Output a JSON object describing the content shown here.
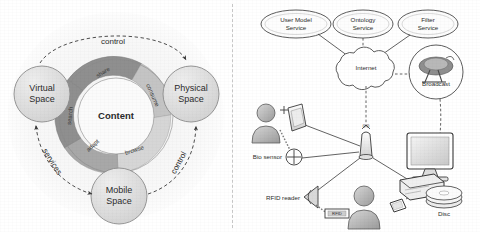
{
  "figure": {
    "divider": "vertical-dashed-separator",
    "background_color": "#ffffff",
    "ink_color": "#2b2b2b"
  },
  "left_diagram": {
    "name": "content-space-cycle",
    "center_label": "Content",
    "spaces": [
      {
        "id": "virtual",
        "label_line1": "Virtual",
        "label_line2": "Space",
        "fill": "#dcdcdc"
      },
      {
        "id": "physical",
        "label_line1": "Physical",
        "label_line2": "Space",
        "fill": "#dcdcdc"
      },
      {
        "id": "mobile",
        "label_line1": "Mobile",
        "label_line2": "Space",
        "fill": "#dcdcdc"
      }
    ],
    "ring_segments": [
      {
        "id": "share",
        "label": "share",
        "fill": "#8f8f8f"
      },
      {
        "id": "consume",
        "label": "consume",
        "fill": "#c4c4c4"
      },
      {
        "id": "browse",
        "label": "browse",
        "fill": "#d6d6d6"
      },
      {
        "id": "adapt",
        "label": "adapt",
        "fill": "#a8a8a8"
      },
      {
        "id": "search",
        "label": "search",
        "fill": "#8f8f8f"
      }
    ],
    "arrows": [
      {
        "id": "control-top",
        "label": "control",
        "from": "virtual",
        "to": "physical",
        "style": "single"
      },
      {
        "id": "services-left",
        "label": "services",
        "from": "virtual",
        "to": "mobile",
        "style": "double"
      },
      {
        "id": "control-right",
        "label": "control",
        "from": "mobile",
        "to": "physical",
        "style": "single"
      }
    ]
  },
  "right_diagram": {
    "name": "ubiquitous-service-architecture",
    "services": [
      {
        "id": "user-model-service",
        "line1": "User Model",
        "line2": "Service"
      },
      {
        "id": "ontology-service",
        "line1": "Ontology",
        "line2": "Service"
      },
      {
        "id": "filter-service",
        "line1": "Filter",
        "line2": "Service"
      }
    ],
    "cloud": {
      "id": "internet-cloud",
      "label": "Internet"
    },
    "broadcast": {
      "id": "broadcast-node",
      "label": "Broadcast"
    },
    "nodes": [
      {
        "id": "access-point",
        "label": ""
      },
      {
        "id": "pda-device",
        "label": ""
      },
      {
        "id": "bio-sensor",
        "label": "Bio sensor"
      },
      {
        "id": "rfid-reader",
        "label": "RFID reader"
      },
      {
        "id": "rfid-tag",
        "label": "RFID"
      },
      {
        "id": "desktop-computer",
        "label": ""
      },
      {
        "id": "set-top-box",
        "label": ""
      },
      {
        "id": "disc-stack",
        "label": "Disc"
      },
      {
        "id": "person-top",
        "label": ""
      },
      {
        "id": "person-bottom",
        "label": ""
      },
      {
        "id": "mobile-phone",
        "label": ""
      }
    ]
  }
}
